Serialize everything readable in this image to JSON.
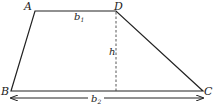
{
  "diagram": {
    "type": "trapezoid",
    "vertices": {
      "A": {
        "label": "A",
        "x": 35,
        "y": 11
      },
      "D": {
        "label": "D",
        "x": 116,
        "y": 11
      },
      "B": {
        "label": "B",
        "x": 11,
        "y": 91
      },
      "C": {
        "label": "C",
        "x": 203,
        "y": 91
      }
    },
    "labels": {
      "top_base": "b",
      "top_base_sub": "1",
      "height": "h",
      "bottom_base": "b",
      "bottom_base_sub": "2"
    },
    "colors": {
      "stroke": "#222222",
      "background": "#ffffff"
    }
  }
}
